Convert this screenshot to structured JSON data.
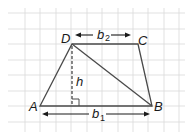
{
  "diagram": {
    "type": "trapezoid-area",
    "vertices": {
      "A": {
        "label": "A",
        "x": 40,
        "y": 106
      },
      "B": {
        "label": "B",
        "x": 152,
        "y": 106
      },
      "C": {
        "label": "C",
        "x": 138,
        "y": 44
      },
      "D": {
        "label": "D",
        "x": 72,
        "y": 44
      }
    },
    "height_label": "h",
    "base1_label": "b",
    "base1_sub": "1",
    "base2_label": "b",
    "base2_sub": "2",
    "colors": {
      "grid": "#d9d9d9",
      "stroke": "#4a4a4a",
      "text": "#1a1a1a"
    }
  }
}
